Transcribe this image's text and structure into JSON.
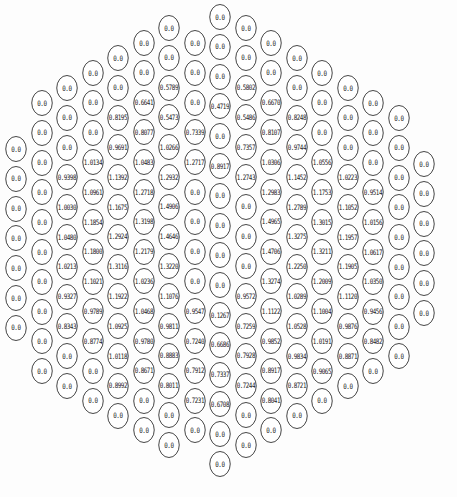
{
  "geometry": {
    "col_x0": 17,
    "col_dx": 25.5,
    "row_dy": 29.8
  },
  "columns": [
    {
      "col": 0,
      "y0": 150,
      "values": [
        "0.0",
        "0.0",
        "0.0",
        "0.0",
        "0.0",
        "0.0",
        "0.0"
      ]
    },
    {
      "col": 1,
      "y0": 104,
      "values": [
        "0.0",
        "0.0",
        "0.0",
        "0.0",
        "0.0",
        "0.0",
        "0.0",
        "0.0",
        "0.0",
        "0.0"
      ]
    },
    {
      "col": 2,
      "y0": 89,
      "values": [
        "0.0",
        "0.0",
        "0.0",
        "0.9398",
        "1.0030",
        "1.0480",
        "1.0213",
        "0.9327",
        "0.8343",
        "0.0",
        "0.0"
      ]
    },
    {
      "col": 3,
      "y0": 74,
      "values": [
        "0.0",
        "0.0",
        "0.0",
        "1.0134",
        "1.0961",
        "1.1854",
        "1.1800",
        "1.1021",
        "0.9789",
        "0.8774",
        "0.0",
        "0.0"
      ]
    },
    {
      "col": 4,
      "y0": 59,
      "values": [
        "0.0",
        "0.0",
        "0.8195",
        "0.9691",
        "1.1392",
        "1.1675",
        "1.2924",
        "1.3116",
        "1.1922",
        "1.0925",
        "1.0118",
        "0.8992",
        "0.0"
      ]
    },
    {
      "col": 5,
      "y0": 44,
      "values": [
        "0.0",
        "0.0",
        "0.6641",
        "0.8077",
        "1.0483",
        "1.2718",
        "1.3198",
        "1.2179",
        "1.0236",
        "1.0468",
        "0.9780",
        "0.8671",
        "0.0",
        "0.0"
      ]
    },
    {
      "col": 6,
      "y0": 29,
      "values": [
        "0.0",
        "0.0",
        "0.5789",
        "0.5473",
        "1.0266",
        "1.2932",
        "1.4906",
        "1.4646",
        "1.3220",
        "1.1076",
        "0.9811",
        "0.8883",
        "0.8011",
        "0.0",
        "0.0"
      ]
    },
    {
      "col": 7,
      "y0": 44,
      "values": [
        "0.0",
        "0.0",
        "0.0",
        "0.7339",
        "1.2717",
        "0.0",
        "0.0",
        "0.0",
        "0.0",
        "0.9547",
        "0.7240",
        "0.7912",
        "0.7231",
        "0.0"
      ]
    },
    {
      "col": 8,
      "y0": 18,
      "values": [
        "0.0",
        "0.0",
        "0.0",
        "0.4719",
        "0.0",
        "0.8917",
        "0.0",
        "0.0",
        "0.0",
        "0.0",
        "0.1267",
        "0.6686",
        "0.7337",
        "0.6708",
        "0.0",
        "0.0"
      ]
    },
    {
      "col": 9,
      "y0": 29,
      "values": [
        "0.0",
        "0.0",
        "0.5802",
        "0.5486",
        "0.7357",
        "1.2743",
        "0.0",
        "0.0",
        "0.0",
        "0.9572",
        "0.7259",
        "0.7928",
        "0.7244",
        "0.0",
        "0.0"
      ]
    },
    {
      "col": 10,
      "y0": 44,
      "values": [
        "0.0",
        "0.0",
        "0.6670",
        "0.8107",
        "1.0306",
        "1.2983",
        "1.4965",
        "1.4706",
        "1.3274",
        "1.1122",
        "0.9852",
        "0.8917",
        "0.8041",
        "0.0"
      ]
    },
    {
      "col": 11,
      "y0": 59,
      "values": [
        "0.0",
        "0.0",
        "0.8248",
        "0.9744",
        "1.1452",
        "1.2789",
        "1.3275",
        "1.2250",
        "1.0289",
        "1.0528",
        "0.9834",
        "0.8721",
        "0.0"
      ]
    },
    {
      "col": 12,
      "y0": 74,
      "values": [
        "0.0",
        "0.0",
        "0.0",
        "1.0556",
        "1.1753",
        "1.3015",
        "1.3211",
        "1.2009",
        "1.1004",
        "1.0191",
        "0.9065",
        "0.0"
      ]
    },
    {
      "col": 13,
      "y0": 89,
      "values": [
        "0.0",
        "0.0",
        "0.0",
        "1.0223",
        "1.1052",
        "1.1957",
        "1.1905",
        "1.1120",
        "0.9876",
        "0.8871",
        "0.0"
      ]
    },
    {
      "col": 14,
      "y0": 104,
      "values": [
        "0.0",
        "0.0",
        "0.0",
        "0.9514",
        "1.0156",
        "1.0617",
        "1.0350",
        "0.9456",
        "0.8482",
        "0.0"
      ]
    },
    {
      "col": 15,
      "y0": 119,
      "values": [
        "0.0",
        "0.0",
        "0.0",
        "0.0",
        "0.0",
        "0.0",
        "0.0",
        "0.0",
        "0.0"
      ]
    },
    {
      "col": 16,
      "y0": 165,
      "values": [
        "0.0",
        "0.0",
        "0.0",
        "0.0",
        "0.0",
        "0.0"
      ]
    }
  ]
}
